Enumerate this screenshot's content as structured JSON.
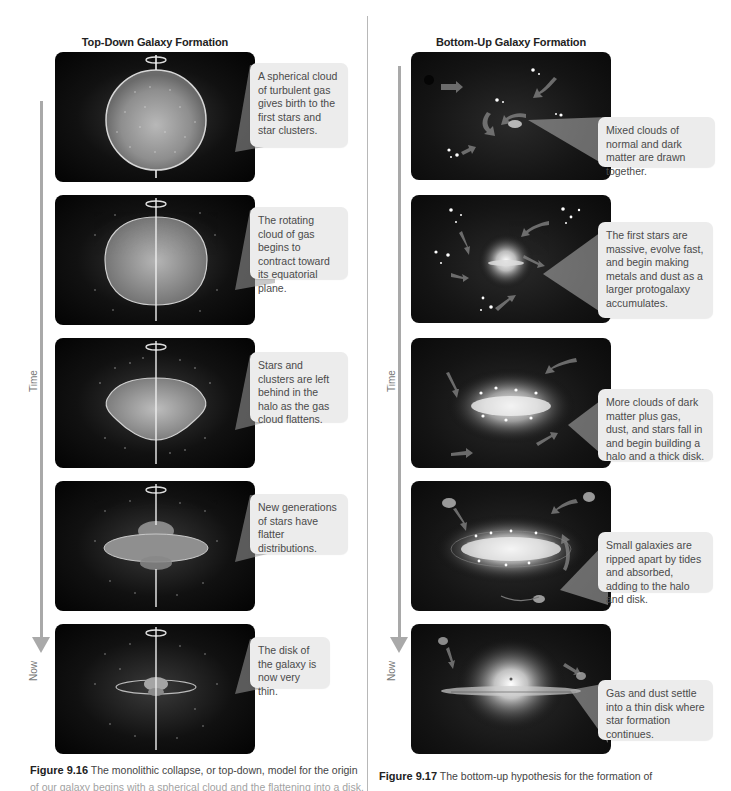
{
  "left": {
    "title": "Top-Down Galaxy Formation",
    "timeline": {
      "start_label": "Time",
      "end_label": "Now"
    },
    "panels": [
      {
        "stage": "spherical-cloud",
        "callout": "A spherical cloud of turbulent gas gives birth to the first stars and star clusters."
      },
      {
        "stage": "rotating-contracting-cloud",
        "callout": "The rotating cloud of gas begins to contract toward its equatorial plane."
      },
      {
        "stage": "flattening-cloud",
        "callout": "Stars and clusters are left behind in the halo as the gas cloud flattens."
      },
      {
        "stage": "flatter-generations",
        "callout": "New generations of stars have flatter distributions."
      },
      {
        "stage": "thin-disk",
        "callout": "The disk of the galaxy is now very thin."
      }
    ],
    "caption": {
      "label": "Figure 9.16",
      "text": "The monolithic collapse, or top-down, model for the origin",
      "continuation": "of our galaxy begins with a spherical cloud and the flattening into a disk."
    }
  },
  "right": {
    "title": "Bottom-Up Galaxy Formation",
    "timeline": {
      "start_label": "Time",
      "end_label": "Now"
    },
    "panels": [
      {
        "stage": "mixed-clouds",
        "callout": "Mixed clouds of normal and dark matter are drawn together."
      },
      {
        "stage": "first-stars",
        "callout": "The first stars are massive, evolve fast, and begin making metals and dust as a larger protogalaxy accumulates."
      },
      {
        "stage": "halo-thick-disk",
        "callout": "More clouds of dark matter plus gas, dust, and stars fall in and begin building a halo and a thick disk."
      },
      {
        "stage": "small-galaxies-absorbed",
        "callout": "Small galaxies are ripped apart by tides and absorbed, adding to the halo and disk."
      },
      {
        "stage": "thin-disk-settle",
        "callout": "Gas and dust settle into a thin disk where star formation continues."
      }
    ],
    "caption": {
      "label": "Figure 9.17",
      "text": "The bottom-up hypothesis for the formation of"
    }
  },
  "colors": {
    "timeline": "#a9a9a9",
    "callout_bg": "#ececec",
    "panel_bg": "#0a0a0a",
    "divider": "#b8b8b8"
  }
}
